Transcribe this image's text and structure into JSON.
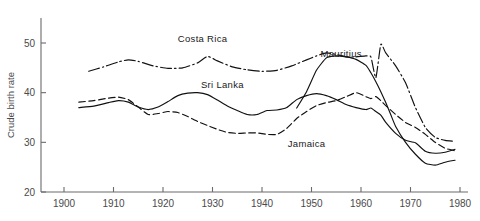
{
  "chart_data": {
    "type": "line",
    "title": "",
    "xlabel": "",
    "ylabel": "Crude birth rate",
    "xlim": [
      1897,
      1980
    ],
    "ylim": [
      20,
      53
    ],
    "grid": false,
    "legend_position": "inline-annotations",
    "x_ticks": [
      1900,
      1910,
      1920,
      1930,
      1940,
      1950,
      1960,
      1970,
      1980
    ],
    "x_tick_labels": [
      "1900",
      "1910",
      "1920",
      "1930",
      "1940",
      "1950",
      "1960",
      "1970",
      "1980"
    ],
    "y_ticks": [
      20,
      30,
      40,
      50
    ],
    "y_tick_labels": [
      "20",
      "30",
      "40",
      "50"
    ],
    "series": [
      {
        "name": "Costa Rica",
        "style": "dash-dot",
        "label_x": 1928,
        "label_y": 50.2,
        "x": [
          1905,
          1908,
          1911,
          1913,
          1915,
          1918,
          1921,
          1924,
          1927,
          1929,
          1931,
          1934,
          1937,
          1940,
          1943,
          1946,
          1949,
          1951,
          1953,
          1955,
          1957,
          1959,
          1961,
          1962,
          1963,
          1964,
          1965,
          1967,
          1969,
          1971,
          1973,
          1975,
          1977,
          1979
        ],
        "y": [
          44.3,
          45.2,
          46.2,
          46.6,
          46.3,
          45.4,
          44.9,
          45.0,
          46.0,
          47.3,
          46.4,
          45.2,
          44.6,
          44.3,
          44.5,
          45.4,
          46.6,
          47.4,
          48.0,
          47.7,
          47.2,
          47.2,
          47.4,
          47.2,
          43.0,
          49.7,
          48.0,
          45.4,
          42.0,
          37.0,
          33.0,
          31.0,
          30.4,
          30.2
        ]
      },
      {
        "name": "Mauritius",
        "style": "solid",
        "label_x": 1956,
        "label_y": 47.1,
        "x": [
          1947,
          1949,
          1951,
          1953,
          1955,
          1957,
          1959,
          1961,
          1962,
          1963,
          1964,
          1965,
          1966,
          1967,
          1969,
          1971,
          1973,
          1975,
          1977,
          1979
        ],
        "y": [
          36.9,
          40.2,
          44.5,
          47.0,
          47.4,
          47.2,
          46.7,
          45.5,
          44.0,
          42.2,
          40.2,
          38.0,
          35.6,
          33.2,
          30.0,
          27.6,
          25.8,
          25.4,
          26.0,
          26.4
        ]
      },
      {
        "name": "Sri Lanka",
        "style": "solid",
        "label_x": 1932,
        "label_y": 41.0,
        "x": [
          1903,
          1906,
          1909,
          1911,
          1913,
          1915,
          1917,
          1919,
          1921,
          1923,
          1925,
          1927,
          1929,
          1931,
          1933,
          1935,
          1937,
          1939,
          1941,
          1943,
          1945,
          1947,
          1949,
          1951,
          1953,
          1955,
          1957,
          1959,
          1961,
          1962,
          1963,
          1964,
          1965,
          1967,
          1969,
          1971,
          1973,
          1975,
          1977,
          1979
        ],
        "y": [
          37.0,
          37.3,
          38.0,
          38.4,
          38.1,
          37.1,
          36.6,
          37.1,
          38.2,
          39.4,
          39.9,
          40.0,
          39.6,
          38.5,
          37.3,
          36.4,
          35.6,
          35.6,
          36.4,
          36.5,
          37.0,
          38.6,
          39.4,
          39.8,
          39.4,
          38.6,
          37.6,
          37.0,
          36.6,
          36.9,
          36.2,
          35.5,
          34.0,
          31.8,
          30.4,
          29.9,
          28.2,
          27.8,
          28.0,
          28.6
        ]
      },
      {
        "name": "Jamaica",
        "style": "dashed",
        "label_x": 1949,
        "label_y": 29.1,
        "x": [
          1903,
          1906,
          1909,
          1911,
          1913,
          1915,
          1917,
          1919,
          1921,
          1923,
          1925,
          1927,
          1929,
          1931,
          1933,
          1935,
          1937,
          1939,
          1941,
          1943,
          1945,
          1947,
          1949,
          1951,
          1953,
          1955,
          1957,
          1959,
          1961,
          1962,
          1963,
          1964,
          1965,
          1967,
          1969,
          1971,
          1973,
          1975,
          1977,
          1979
        ],
        "y": [
          38.1,
          38.4,
          38.9,
          39.1,
          38.6,
          37.1,
          35.6,
          35.8,
          36.2,
          36.0,
          35.2,
          34.2,
          33.4,
          32.6,
          32.0,
          31.8,
          31.9,
          31.9,
          31.6,
          31.6,
          32.8,
          34.8,
          36.2,
          37.4,
          38.0,
          38.4,
          39.2,
          40.0,
          39.2,
          38.8,
          39.2,
          38.4,
          37.4,
          35.6,
          34.0,
          33.0,
          31.6,
          30.0,
          28.8,
          28.3
        ]
      }
    ]
  },
  "axis": {
    "y_title": "Crude birth rate"
  }
}
